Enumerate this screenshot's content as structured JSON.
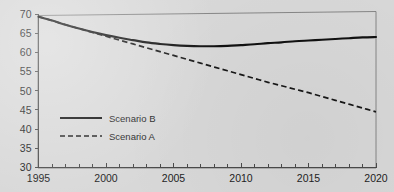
{
  "chart_data": {
    "type": "line",
    "title": "",
    "subtitle": "",
    "xlabel": "",
    "ylabel": "",
    "xlim": [
      1995,
      2020
    ],
    "ylim": [
      30,
      70
    ],
    "grid": false,
    "legend_position": "inside-left-lower",
    "x_tick_labels": [
      "1995",
      "2000",
      "2005",
      "2010",
      "2015",
      "2020"
    ],
    "x_tick_values": [
      1995,
      2000,
      2005,
      2010,
      2015,
      2020
    ],
    "x_minor_tick_step": 1,
    "y_tick_labels": [
      "30",
      "35",
      "40",
      "45",
      "50",
      "55",
      "60",
      "65",
      "70"
    ],
    "y_tick_values": [
      30,
      35,
      40,
      45,
      50,
      55,
      60,
      65,
      70
    ],
    "x": [
      1995,
      1996,
      1997,
      1998,
      1999,
      2000,
      2001,
      2002,
      2003,
      2004,
      2005,
      2006,
      2007,
      2008,
      2009,
      2010,
      2011,
      2012,
      2013,
      2014,
      2015,
      2016,
      2017,
      2018,
      2019,
      2020
    ],
    "series": [
      {
        "name": "Scenario B",
        "style": "solid",
        "color": "#111111",
        "values": [
          69.3,
          68.3,
          67.2,
          66.2,
          65.3,
          64.5,
          63.8,
          63.2,
          62.6,
          62.2,
          61.9,
          61.7,
          61.6,
          61.6,
          61.7,
          61.9,
          62.1,
          62.4,
          62.6,
          62.9,
          63.1,
          63.3,
          63.5,
          63.7,
          63.9,
          64.0
        ]
      },
      {
        "name": "Scenario A",
        "style": "dashed",
        "color": "#171717",
        "values": [
          69.3,
          68.3,
          67.2,
          66.2,
          65.2,
          64.2,
          63.2,
          62.2,
          61.2,
          60.2,
          59.2,
          58.2,
          57.2,
          56.2,
          55.2,
          54.2,
          53.2,
          52.2,
          51.3,
          50.4,
          49.5,
          48.5,
          47.5,
          46.5,
          45.5,
          44.5
        ]
      }
    ],
    "legend": [
      {
        "label": "Scenario B",
        "style": "solid"
      },
      {
        "label": "Scenario A",
        "style": "dashed"
      }
    ],
    "annotations": []
  }
}
